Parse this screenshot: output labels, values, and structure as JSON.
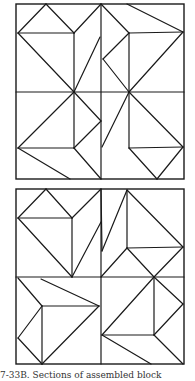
{
  "figure": {
    "stroke_color": "#1a1a1a",
    "background": "#ffffff",
    "caption": "7-33B. Sections of assembled block",
    "blocks": [
      {
        "name": "top-block",
        "frame": [
          16,
          4,
          184,
          179
        ],
        "midlines": {
          "x": 101,
          "y": 92
        },
        "lines": [
          [
            18,
            33,
            46,
            4
          ],
          [
            46,
            4,
            74,
            33
          ],
          [
            18,
            33,
            74,
            33
          ],
          [
            74,
            33,
            74,
            92
          ],
          [
            18,
            33,
            74,
            92
          ],
          [
            74,
            33,
            101,
            4
          ],
          [
            100,
            37,
            74,
            92
          ],
          [
            127,
            4,
            183,
            32
          ],
          [
            129,
            33,
            183,
            32
          ],
          [
            129,
            33,
            129,
            92
          ],
          [
            129,
            33,
            103,
            59
          ],
          [
            103,
            59,
            129,
            92
          ],
          [
            183,
            32,
            129,
            92
          ],
          [
            101,
            4,
            129,
            33
          ],
          [
            74,
            92,
            18,
            148
          ],
          [
            18,
            148,
            74,
            148
          ],
          [
            74,
            92,
            74,
            148
          ],
          [
            74,
            92,
            101,
            121
          ],
          [
            101,
            121,
            74,
            148
          ],
          [
            18,
            148,
            70,
            179
          ],
          [
            74,
            148,
            101,
            179
          ],
          [
            129,
            92,
            102,
            147
          ],
          [
            129,
            92,
            129,
            148
          ],
          [
            129,
            92,
            183,
            147
          ],
          [
            129,
            148,
            183,
            147
          ],
          [
            129,
            148,
            157,
            179
          ],
          [
            183,
            147,
            157,
            179
          ]
        ]
      },
      {
        "name": "bottom-block",
        "frame": [
          16,
          189,
          184,
          364
        ],
        "midlines": {
          "x": 101,
          "y": 277
        },
        "lines": [
          [
            18,
            218,
            46,
            189
          ],
          [
            46,
            189,
            72,
            218
          ],
          [
            18,
            218,
            72,
            218
          ],
          [
            72,
            218,
            72,
            277
          ],
          [
            18,
            218,
            72,
            277
          ],
          [
            72,
            218,
            101,
            189
          ],
          [
            101,
            222,
            72,
            277
          ],
          [
            101,
            189,
            102,
            251
          ],
          [
            102,
            251,
            127,
            190
          ],
          [
            127,
            190,
            183,
            247
          ],
          [
            127,
            190,
            127,
            248
          ],
          [
            127,
            248,
            183,
            247
          ],
          [
            127,
            248,
            101,
            277
          ],
          [
            127,
            248,
            154,
            277
          ],
          [
            183,
            247,
            154,
            277
          ],
          [
            18,
            278,
            42,
            306
          ],
          [
            42,
            306,
            42,
            364
          ],
          [
            42,
            306,
            18,
            338
          ],
          [
            18,
            338,
            42,
            364
          ],
          [
            42,
            306,
            99,
            306
          ],
          [
            42,
            364,
            99,
            306
          ],
          [
            41,
            279,
            99,
            306
          ],
          [
            154,
            277,
            183,
            304
          ],
          [
            154,
            277,
            154,
            335
          ],
          [
            154,
            277,
            102,
            335
          ],
          [
            102,
            335,
            154,
            335
          ],
          [
            154,
            335,
            183,
            304
          ],
          [
            154,
            335,
            183,
            364
          ],
          [
            102,
            335,
            151,
            364
          ]
        ]
      }
    ]
  }
}
